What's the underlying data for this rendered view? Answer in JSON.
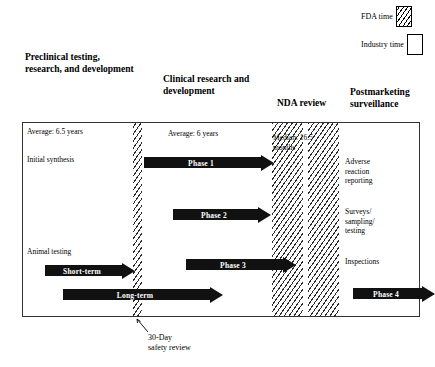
{
  "diagram": {
    "legend": {
      "fda": {
        "label": "FDA\ntime",
        "swatch": "hatched-box",
        "pattern": "diagonal-hatch"
      },
      "industry": {
        "label": "Industry\ntime",
        "swatch": "empty-box",
        "pattern": "solid-white"
      }
    },
    "columns": [
      {
        "id": "preclinical",
        "header": "Preclinical\ntesting,\nresearch, and\ndevelopment"
      },
      {
        "id": "clinical",
        "header": "Clinical\nresearch and\ndevelopment"
      },
      {
        "id": "nda",
        "header": "NDA review"
      },
      {
        "id": "postmarketing",
        "header": "Postmarketing\nsurveillance"
      }
    ],
    "durations": [
      {
        "id": "avg-preclinical",
        "text": "Average: 6.5 years",
        "value": 6.5,
        "unit": "years",
        "column": "preclinical"
      },
      {
        "id": "avg-clinical",
        "text": "Average: 6 years",
        "value": 6,
        "unit": "years",
        "column": "clinical"
      },
      {
        "id": "median-nda",
        "text": "Median:  16.5\nmonths",
        "value": 16.5,
        "unit": "months",
        "column": "nda"
      }
    ],
    "activities": [
      {
        "id": "initial-synthesis",
        "text": "Initial synthesis",
        "column": "preclinical"
      },
      {
        "id": "animal-testing",
        "text": "Animal testing",
        "column": "preclinical"
      },
      {
        "id": "adverse-reaction",
        "text": "Adverse\nreaction\nreporting",
        "column": "postmarketing"
      },
      {
        "id": "surveys",
        "text": "Surveys/\nsampling/\ntesting",
        "column": "postmarketing"
      },
      {
        "id": "inspections",
        "text": "Inspections",
        "column": "postmarketing"
      }
    ],
    "arrows": [
      {
        "id": "phase-1",
        "label": "Phase 1",
        "column": "clinical"
      },
      {
        "id": "phase-2",
        "label": "Phase 2",
        "column": "clinical"
      },
      {
        "id": "phase-3",
        "label": "Phase 3",
        "column": "clinical"
      },
      {
        "id": "phase-4",
        "label": "Phase 4",
        "column": "postmarketing"
      },
      {
        "id": "short-term",
        "label": "Short-term",
        "column": "preclinical"
      },
      {
        "id": "long-term",
        "label": "Long-term",
        "column": "preclinical"
      }
    ],
    "callouts": [
      {
        "id": "thirty-day-safety-review",
        "text": "30-Day\nsafety review"
      }
    ],
    "colors": {
      "arrow_fill": "#111111",
      "arrow_text": "#ffffff",
      "hatch_line": "#2b2b2b",
      "box_border": "#333333",
      "background": "#ffffff"
    }
  }
}
